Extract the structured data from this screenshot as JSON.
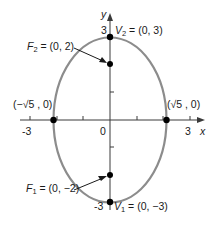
{
  "diagram": {
    "type": "ellipse-graph",
    "equation_center": [
      0,
      0
    ],
    "major_axis": "vertical",
    "a": 3,
    "b": "sqrt(5)",
    "c": 2,
    "colors": {
      "ellipse": "#8c8c8c",
      "axes": "#3a3a3a",
      "points": "#000000",
      "text": "#1a1a1a"
    },
    "axes": {
      "x_label": "x",
      "y_label": "y",
      "x_ticks": [
        "-3",
        "0",
        "3"
      ],
      "y_ticks": [
        "3",
        "-3"
      ]
    },
    "points": [
      {
        "name": "V2",
        "label_main": "V",
        "label_sub": "2",
        "label_rest": " = (0, 3)",
        "x": 0,
        "y": 3
      },
      {
        "name": "F2",
        "label_main": "F",
        "label_sub": "2",
        "label_rest": " = (0, 2)",
        "x": 0,
        "y": 2
      },
      {
        "name": "F1",
        "label_main": "F",
        "label_sub": "1",
        "label_rest": " = (0, −2)",
        "x": 0,
        "y": -2
      },
      {
        "name": "V1",
        "label_main": "V",
        "label_sub": "1",
        "label_rest": " = (0, −3)",
        "x": 0,
        "y": -3
      },
      {
        "name": "left-vertex",
        "label": "(−√5 , 0)",
        "x": "-sqrt(5)",
        "y": 0
      },
      {
        "name": "right-vertex",
        "label": "(√5 , 0)",
        "x": "sqrt(5)",
        "y": 0
      }
    ]
  }
}
